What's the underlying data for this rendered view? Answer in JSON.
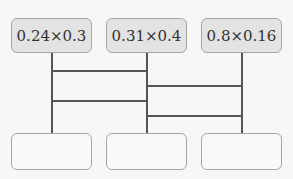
{
  "expressions": [
    "0.24×0.3",
    "0.31×0.4",
    "0.8×0.16"
  ],
  "answers": [
    "",
    "",
    ""
  ],
  "colors": {
    "top_box_fill": "#e3e3e3",
    "border": "#a6a6a6",
    "line": "#555555",
    "background": "#f7f7f7"
  }
}
